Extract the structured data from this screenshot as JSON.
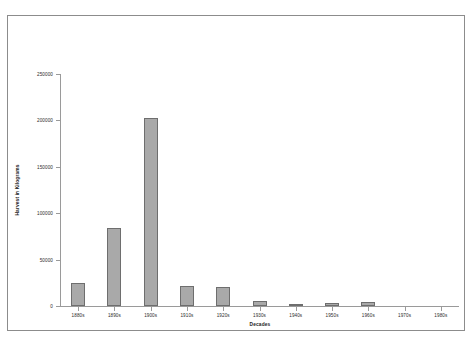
{
  "chart_data": {
    "type": "bar",
    "title": "",
    "xlabel": "Decades",
    "ylabel": "Harvest in Kilograms",
    "categories": [
      "1880s",
      "1890s",
      "1900s",
      "1910s",
      "1920s",
      "1930s",
      "1940s",
      "1950s",
      "1960s",
      "1970s",
      "1980s"
    ],
    "values": [
      25000,
      84000,
      203000,
      22000,
      21000,
      5000,
      2000,
      3000,
      4000,
      0,
      0
    ],
    "ylim": [
      0,
      250000
    ],
    "yticks": [
      0,
      50000,
      100000,
      150000,
      200000,
      250000
    ],
    "ytick_labels": [
      "0",
      "50000",
      "100000",
      "150000",
      "200000",
      "250000"
    ],
    "grid": false,
    "legend": false,
    "bar_color": "#a9a9a9",
    "bar_edge_color": "#6e6e6e",
    "axis_color": "#9a9a9a",
    "frame_color": "#8c8c8c",
    "background": "#ffffff"
  }
}
